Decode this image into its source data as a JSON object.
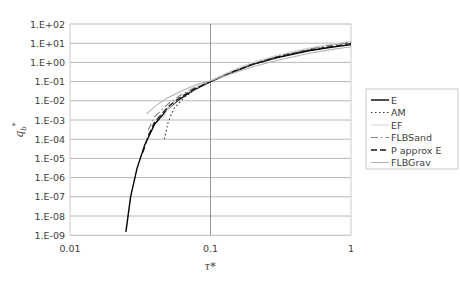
{
  "chart_data": {
    "type": "line",
    "title": "",
    "xlabel": "τ*",
    "ylabel": "q_b*",
    "xscale": "log",
    "yscale": "log",
    "xlim": [
      0.01,
      1
    ],
    "ylim": [
      1e-09,
      100
    ],
    "x_ticks": [
      "0.01",
      "0.1",
      "1"
    ],
    "y_ticks": [
      "1.E+02",
      "1.E+01",
      "1.E+00",
      "1.E-01",
      "1.E-02",
      "1.E-03",
      "1.E-04",
      "1.E-05",
      "1.E-06",
      "1.E-07",
      "1.E-08",
      "1.E-09"
    ],
    "grid": {
      "horizontal": true,
      "vertical": true
    },
    "legend_position": "right",
    "series": [
      {
        "name": "E",
        "style": "solid",
        "color": "#000000",
        "width": 1.4,
        "points": [
          [
            0.025,
            1.5e-09
          ],
          [
            0.027,
            1e-07
          ],
          [
            0.03,
            3e-06
          ],
          [
            0.034,
            5e-05
          ],
          [
            0.04,
            0.0006
          ],
          [
            0.05,
            0.004
          ],
          [
            0.06,
            0.012
          ],
          [
            0.075,
            0.035
          ],
          [
            0.1,
            0.1
          ],
          [
            0.15,
            0.35
          ],
          [
            0.2,
            0.8
          ],
          [
            0.3,
            1.8
          ],
          [
            0.5,
            4
          ],
          [
            0.7,
            6
          ],
          [
            1.0,
            8.5
          ]
        ]
      },
      {
        "name": "AM",
        "style": "dotted",
        "color": "#333333",
        "width": 1.1,
        "points": [
          [
            0.047,
            0.0001
          ],
          [
            0.05,
            0.0008
          ],
          [
            0.055,
            0.004
          ],
          [
            0.065,
            0.015
          ],
          [
            0.08,
            0.045
          ],
          [
            0.1,
            0.1
          ],
          [
            0.15,
            0.4
          ],
          [
            0.2,
            0.9
          ],
          [
            0.3,
            2.2
          ],
          [
            0.5,
            5.2
          ],
          [
            0.7,
            8
          ],
          [
            1.0,
            12
          ]
        ]
      },
      {
        "name": "EF",
        "style": "solid",
        "color": "#d9d9d9",
        "width": 1.2,
        "points": [
          [
            0.045,
            0.001
          ],
          [
            0.05,
            0.004
          ],
          [
            0.06,
            0.014
          ],
          [
            0.075,
            0.04
          ],
          [
            0.1,
            0.11
          ],
          [
            0.15,
            0.45
          ],
          [
            0.2,
            1.0
          ],
          [
            0.3,
            2.4
          ],
          [
            0.5,
            5.5
          ],
          [
            0.7,
            8.5
          ],
          [
            1.0,
            13
          ]
        ]
      },
      {
        "name": "FLBSand",
        "style": "dashdot",
        "color": "#808080",
        "width": 1.1,
        "points": [
          [
            0.036,
            0.0003
          ],
          [
            0.04,
            0.0015
          ],
          [
            0.05,
            0.007
          ],
          [
            0.06,
            0.018
          ],
          [
            0.075,
            0.045
          ],
          [
            0.1,
            0.1
          ],
          [
            0.15,
            0.38
          ],
          [
            0.2,
            0.85
          ],
          [
            0.3,
            2.0
          ],
          [
            0.5,
            4.8
          ],
          [
            0.7,
            7.5
          ],
          [
            1.0,
            11
          ]
        ]
      },
      {
        "name": "P approx E",
        "style": "dashed",
        "color": "#1a1a1a",
        "width": 1.3,
        "points": [
          [
            0.033,
            2e-05
          ],
          [
            0.036,
            0.00015
          ],
          [
            0.04,
            0.0008
          ],
          [
            0.05,
            0.005
          ],
          [
            0.06,
            0.014
          ],
          [
            0.075,
            0.038
          ],
          [
            0.1,
            0.1
          ],
          [
            0.15,
            0.36
          ],
          [
            0.2,
            0.8
          ],
          [
            0.3,
            1.9
          ],
          [
            0.5,
            4.3
          ],
          [
            0.7,
            6.5
          ],
          [
            1.0,
            9.5
          ]
        ]
      },
      {
        "name": "FLBGrav",
        "style": "solid",
        "color": "#b3b3b3",
        "width": 1.1,
        "points": [
          [
            0.035,
            0.002
          ],
          [
            0.04,
            0.005
          ],
          [
            0.05,
            0.015
          ],
          [
            0.065,
            0.038
          ],
          [
            0.08,
            0.07
          ],
          [
            0.1,
            0.11
          ],
          [
            0.15,
            0.3
          ],
          [
            0.2,
            0.6
          ],
          [
            0.3,
            1.3
          ],
          [
            0.5,
            2.9
          ],
          [
            0.7,
            4.5
          ],
          [
            1.0,
            6.5
          ]
        ]
      }
    ]
  }
}
